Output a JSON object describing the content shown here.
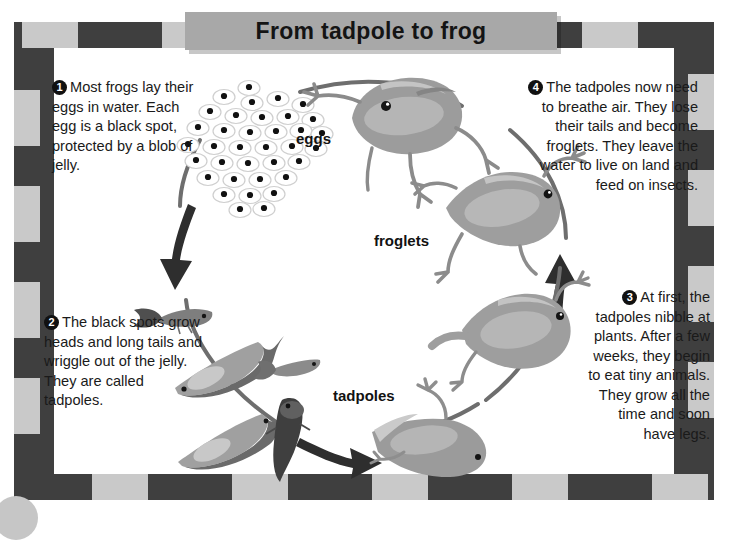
{
  "title": "From tadpole to frog",
  "steps": [
    {
      "number": "1",
      "text": "Most frogs lay their eggs in water. Each egg is a black spot, protected by a blob of jelly."
    },
    {
      "number": "2",
      "text": "The black spots grow heads and long tails and wriggle out of the jelly. They are called tadpoles."
    },
    {
      "number": "3",
      "text": "At first, the tadpoles nibble at plants. After a few weeks, they begin to eat tiny animals. They grow all the time and soon have legs."
    },
    {
      "number": "4",
      "text": "The tadpoles now need to breathe air. They lose their tails and become froglets. They leave the water to live on land and feed on insects."
    }
  ],
  "captions": {
    "eggs": "eggs",
    "froglets": "froglets",
    "tadpoles": "tadpoles"
  },
  "colors": {
    "frame_dark": "#3f3f3f",
    "frame_light": "#c9c9c9",
    "title_bar": "#a8a8a8",
    "arrow": "#2e2e2e",
    "frog_body": "#9a9a9a",
    "frog_light": "#bdbdbd",
    "tadpole_dark": "#6b6b6b",
    "egg_fill": "#ffffff",
    "egg_dot": "#111111",
    "page_bg": "#ffffff"
  },
  "diagram": {
    "type": "cycle",
    "direction": "clockwise",
    "stage_order": [
      "eggs",
      "tadpoles",
      "tadpoles with legs",
      "froglets",
      "frogs"
    ]
  }
}
